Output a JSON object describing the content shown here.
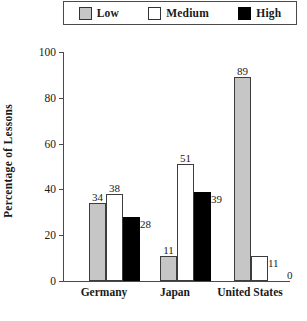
{
  "chart_data": {
    "type": "bar",
    "title": "",
    "xlabel": "",
    "ylabel": "Percentage of Lessons",
    "ylim": [
      0,
      100
    ],
    "yticks": [
      0,
      20,
      40,
      60,
      80,
      100
    ],
    "grid": false,
    "legend_position": "top",
    "categories": [
      "Germany",
      "Japan",
      "United States"
    ],
    "series": [
      {
        "name": "Low",
        "color": "#c6c6c6",
        "values": [
          34,
          38,
          89
        ]
      },
      {
        "name": "Medium",
        "color": "#ffffff",
        "values": [
          38,
          51,
          11
        ]
      },
      {
        "name": "High",
        "color": "#000000",
        "values": [
          28,
          39,
          0
        ]
      }
    ],
    "groups": [
      {
        "category": "Germany",
        "bars": [
          {
            "series": "Low",
            "value": 34,
            "label": "34"
          },
          {
            "series": "Medium",
            "value": 38,
            "label": "38"
          },
          {
            "series": "High",
            "value": 28,
            "label": "28"
          }
        ]
      },
      {
        "category": "Japan",
        "bars": [
          {
            "series": "Low",
            "value": 11,
            "label": "11"
          },
          {
            "series": "Medium",
            "value": 51,
            "label": "51"
          },
          {
            "series": "High",
            "value": 39,
            "label": "39"
          }
        ]
      },
      {
        "category": "United States",
        "bars": [
          {
            "series": "Low",
            "value": 89,
            "label": "89"
          },
          {
            "series": "Medium",
            "value": 11,
            "label": "11"
          },
          {
            "series": "High",
            "value": 0,
            "label": "0"
          }
        ]
      }
    ]
  },
  "legend": {
    "items": [
      {
        "label": "Low",
        "swatch": "gray-swatch-icon"
      },
      {
        "label": "Medium",
        "swatch": "white-swatch-icon"
      },
      {
        "label": "High",
        "swatch": "black-swatch-icon"
      }
    ]
  },
  "axis": {
    "y_title": "Percentage of Lessons",
    "y_tick_labels": [
      "100",
      "80",
      "60",
      "40",
      "20",
      "0"
    ]
  },
  "categories": {
    "germany": "Germany",
    "japan": "Japan",
    "united_states": "United States"
  }
}
